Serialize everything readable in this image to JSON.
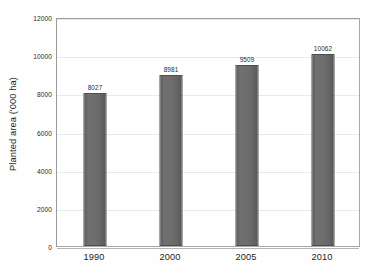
{
  "chart_data": {
    "type": "bar",
    "title": "",
    "subtitle": "",
    "xlabel": "",
    "ylabel": "Planted area ('000 ha)",
    "categories": [
      "1990",
      "2000",
      "2005",
      "2010"
    ],
    "values": [
      8027,
      8981,
      9509,
      10062
    ],
    "value_labels": [
      "8027",
      "8981",
      "9509",
      "10062"
    ],
    "series": [
      {
        "name": "Planted area",
        "values": [
          8027,
          8981,
          9509,
          10062
        ]
      }
    ],
    "ylim": [
      0,
      12000
    ],
    "yticks": [
      0,
      2000,
      4000,
      6000,
      8000,
      10000,
      12000
    ],
    "ytick_labels": [
      "0",
      "2000",
      "4000",
      "6000",
      "8000",
      "10000",
      "12000"
    ],
    "grid": true,
    "grid_axis": "y",
    "legend": false,
    "legend_position": "none",
    "bar_color": "#6b6b6b",
    "bar_edge_color": "#4e4e4e",
    "gridline_color": "#e9e9e9",
    "axis_color": "#a8a8a8",
    "background_color": "#ffffff",
    "data_labels_shown": true
  }
}
